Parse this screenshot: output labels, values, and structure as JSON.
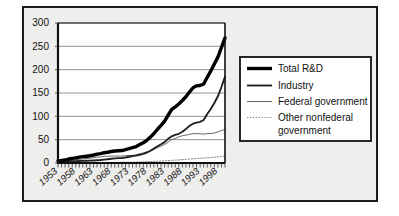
{
  "chart_data": {
    "type": "line",
    "title": "",
    "subtitle": "",
    "xlabel": "",
    "ylabel": "",
    "xlim": [
      1953,
      2000
    ],
    "ylim": [
      0,
      300
    ],
    "yticks": [
      "0",
      "50",
      "100",
      "150",
      "200",
      "250",
      "300"
    ],
    "ytick_values": [
      0,
      50,
      100,
      150,
      200,
      250,
      300
    ],
    "xticks": [
      "1953",
      "1958",
      "1963",
      "1968",
      "1973",
      "1978",
      "1983",
      "1988",
      "1993",
      "1998"
    ],
    "xtick_values": [
      1953,
      1958,
      1963,
      1968,
      1973,
      1978,
      1983,
      1988,
      1993,
      1998
    ],
    "x": [
      1953,
      1954,
      1955,
      1956,
      1957,
      1958,
      1959,
      1960,
      1961,
      1962,
      1963,
      1964,
      1965,
      1966,
      1967,
      1968,
      1969,
      1970,
      1971,
      1972,
      1973,
      1974,
      1975,
      1976,
      1977,
      1978,
      1979,
      1980,
      1981,
      1982,
      1983,
      1984,
      1985,
      1986,
      1987,
      1988,
      1989,
      1990,
      1991,
      1992,
      1993,
      1994,
      1995,
      1996,
      1997,
      1998,
      1999,
      2000
    ],
    "grid": true,
    "grid_axis": "y",
    "legend_position": "right",
    "series": [
      {
        "name": "Total R&D",
        "style": "solid",
        "width": "thick",
        "color": "#000000",
        "values": [
          5.1,
          5.6,
          6.3,
          8.5,
          9.9,
          10.9,
          12.5,
          13.7,
          14.6,
          15.6,
          17.1,
          18.9,
          20.0,
          22.1,
          23.1,
          24.7,
          25.6,
          26.1,
          26.7,
          28.5,
          30.7,
          33.0,
          35.2,
          39.4,
          43.4,
          48.7,
          55.4,
          63.2,
          72.3,
          80.7,
          89.9,
          102.3,
          114.7,
          120.2,
          126.4,
          133.9,
          141.9,
          152.0,
          161.3,
          165.3,
          166.0,
          169.2,
          183.6,
          197.3,
          212.1,
          226.9,
          247.5,
          268.0
        ]
      },
      {
        "name": "Industry",
        "style": "solid",
        "width": "medium",
        "color": "#222222",
        "values": [
          2.2,
          2.4,
          2.5,
          3.3,
          3.6,
          3.9,
          4.4,
          4.5,
          4.7,
          5.0,
          5.4,
          5.9,
          6.5,
          7.3,
          8.1,
          9.0,
          10.0,
          10.4,
          10.8,
          11.7,
          13.3,
          14.9,
          15.8,
          17.7,
          19.6,
          22.5,
          26.1,
          30.9,
          35.9,
          40.1,
          44.8,
          51.7,
          57.1,
          60.3,
          62.6,
          67.0,
          72.8,
          79.5,
          84.2,
          86.6,
          88.0,
          92.1,
          105.1,
          115.6,
          128.5,
          142.9,
          162.9,
          185.0
        ]
      },
      {
        "name": "Federal government",
        "style": "solid",
        "width": "thin",
        "color": "#555555",
        "values": [
          2.8,
          3.1,
          3.7,
          5.0,
          6.2,
          6.8,
          7.9,
          8.7,
          9.6,
          10.3,
          11.4,
          12.6,
          13.0,
          14.2,
          14.4,
          15.0,
          15.0,
          14.9,
          14.9,
          15.8,
          16.0,
          16.3,
          17.6,
          19.6,
          21.6,
          23.6,
          26.1,
          29.5,
          33.1,
          36.4,
          39.4,
          44.6,
          50.3,
          52.4,
          56.2,
          58.4,
          59.8,
          61.3,
          62.7,
          63.0,
          62.5,
          61.8,
          63.0,
          63.3,
          64.1,
          66.8,
          69.5,
          72.0
        ]
      },
      {
        "name": "Other nonfederal government",
        "style": "dotted",
        "width": "thin",
        "color": "#777777",
        "values": [
          0.1,
          0.1,
          0.1,
          0.2,
          0.2,
          0.2,
          0.2,
          0.5,
          0.6,
          0.6,
          0.7,
          0.8,
          0.9,
          1.0,
          1.1,
          1.2,
          1.3,
          1.4,
          1.5,
          1.6,
          1.7,
          1.8,
          2.0,
          2.2,
          2.4,
          2.7,
          3.0,
          3.4,
          3.7,
          4.1,
          4.6,
          5.1,
          5.6,
          6.1,
          6.6,
          7.2,
          7.8,
          8.4,
          9.0,
          9.6,
          10.1,
          10.6,
          11.2,
          11.8,
          12.5,
          13.2,
          14.0,
          14.8
        ]
      }
    ]
  },
  "legend": {
    "entries": [
      {
        "label": "Total R&D"
      },
      {
        "label": "Industry"
      },
      {
        "label": "Federal government"
      },
      {
        "label": "Other nonfederal"
      },
      {
        "label": "government"
      }
    ]
  },
  "colors": {
    "page_background": "#ffffff",
    "panel_background": "#eeeeec",
    "plot_background": "#ffffff",
    "frame": "#1b1b1b",
    "gridline": "#888888"
  }
}
